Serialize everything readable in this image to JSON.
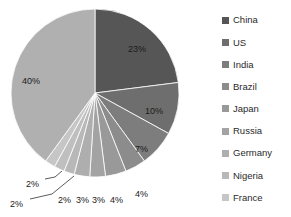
{
  "chart_data": {
    "type": "pie",
    "title": "",
    "categories": [
      "China",
      "US",
      "India",
      "Brazil",
      "Japan",
      "Russia",
      "Germany",
      "Nigeria",
      "France"
    ],
    "values": [
      23,
      10,
      7,
      4,
      4,
      3,
      3,
      2,
      40
    ],
    "extra_slices": [
      {
        "label": "2%",
        "value": 2
      },
      {
        "label": "2%",
        "value": 2
      }
    ],
    "data_labels": [
      "23%",
      "10%",
      "7%",
      "4%",
      "4%",
      "3%",
      "3%",
      "2%",
      "2%",
      "2%",
      "40%"
    ],
    "colors": [
      "#565656",
      "#6e6e6e",
      "#7d7d7d",
      "#8c8c8c",
      "#999999",
      "#a3a3a3",
      "#aeaeae",
      "#b8b8b8",
      "#bfbfbf",
      "#c6c6c6",
      "#b0b0b0"
    ],
    "legend_position": "right",
    "grid": false,
    "start_angle_deg": 0,
    "direction": "clockwise"
  },
  "legend": {
    "items": [
      {
        "label": "China",
        "color": "#565656"
      },
      {
        "label": "US",
        "color": "#6e6e6e"
      },
      {
        "label": "India",
        "color": "#7d7d7d"
      },
      {
        "label": "Brazil",
        "color": "#8c8c8c"
      },
      {
        "label": "Japan",
        "color": "#999999"
      },
      {
        "label": "Russia",
        "color": "#a3a3a3"
      },
      {
        "label": "Germany",
        "color": "#aeaeae"
      },
      {
        "label": "Nigeria",
        "color": "#b8b8b8"
      },
      {
        "label": "France",
        "color": "#c6c6c6"
      }
    ]
  },
  "pie_labels": [
    {
      "text": "23%",
      "x": 128,
      "y": 45
    },
    {
      "text": "10%",
      "x": 145,
      "y": 107
    },
    {
      "text": "7%",
      "x": 135,
      "y": 145
    },
    {
      "text": "4%",
      "x": 135,
      "y": 190
    },
    {
      "text": "4%",
      "x": 110,
      "y": 196
    },
    {
      "text": "3%",
      "x": 92,
      "y": 196
    },
    {
      "text": "3%",
      "x": 76,
      "y": 196
    },
    {
      "text": "2%",
      "x": 58,
      "y": 196
    },
    {
      "text": "2%",
      "x": 26,
      "y": 180
    },
    {
      "text": "2%",
      "x": 10,
      "y": 200
    },
    {
      "text": "40%",
      "x": 22,
      "y": 77
    }
  ],
  "geometry": {
    "cx": 95,
    "cy": 93,
    "r": 84
  }
}
